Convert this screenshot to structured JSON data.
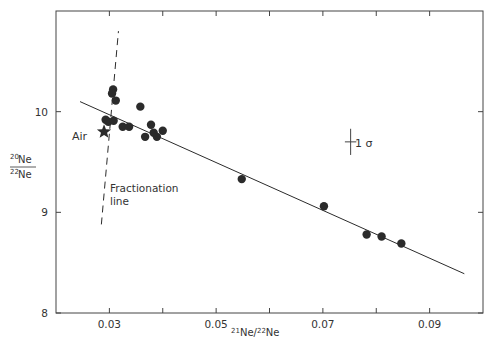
{
  "chart_data": {
    "type": "scatter",
    "title": "",
    "xlabel": "21Ne/22Ne",
    "ylabel": "20Ne/22Ne",
    "xlim": [
      0.02,
      0.1
    ],
    "ylim": [
      8,
      11
    ],
    "x_ticks": [
      0.03,
      0.04,
      0.05,
      0.06,
      0.07,
      0.08,
      0.09
    ],
    "x_tick_labels": [
      "0.03",
      "",
      "0.05",
      "",
      "0.07",
      "",
      "0.09"
    ],
    "y_ticks": [
      8,
      9,
      10
    ],
    "y_tick_labels": [
      "8",
      "9",
      "10"
    ],
    "grid": false,
    "series": [
      {
        "name": "samples",
        "marker": "filled-circle",
        "points": [
          [
            0.0307,
            10.22
          ],
          [
            0.0305,
            10.18
          ],
          [
            0.0312,
            10.11
          ],
          [
            0.0293,
            9.92
          ],
          [
            0.0298,
            9.9
          ],
          [
            0.0308,
            9.91
          ],
          [
            0.0325,
            9.85
          ],
          [
            0.0337,
            9.85
          ],
          [
            0.0358,
            10.05
          ],
          [
            0.0367,
            9.75
          ],
          [
            0.0378,
            9.87
          ],
          [
            0.0383,
            9.79
          ],
          [
            0.0389,
            9.75
          ],
          [
            0.04,
            9.81
          ],
          [
            0.0548,
            9.33
          ],
          [
            0.0702,
            9.06
          ],
          [
            0.0782,
            8.78
          ],
          [
            0.081,
            8.76
          ],
          [
            0.0847,
            8.69
          ]
        ]
      },
      {
        "name": "Air",
        "marker": "star",
        "points": [
          [
            0.029,
            9.8
          ]
        ]
      }
    ],
    "lines": [
      {
        "name": "correlation-line",
        "style": "solid",
        "from": [
          0.0245,
          10.1
        ],
        "to": [
          0.0965,
          8.39
        ]
      },
      {
        "name": "fractionation-line",
        "style": "dashed",
        "from": [
          0.0285,
          8.88
        ],
        "to": [
          0.0317,
          10.8
        ]
      }
    ],
    "error_bar": {
      "label": "1 σ",
      "x": 0.0752,
      "y": 9.7,
      "x_err": 0.0007,
      "y_err": 0.13
    },
    "annotations": [
      {
        "text": "Air",
        "x": 0.025,
        "y": 9.78
      },
      {
        "text": "Fractionation",
        "x": 0.0322,
        "y": 9.18
      },
      {
        "text": "line",
        "x": 0.0322,
        "y": 9.07
      },
      {
        "text": "1 σ",
        "x": 0.0768,
        "y": 9.71
      }
    ]
  },
  "labels": {
    "ylabel_num": "20Ne",
    "ylabel_den": "22Ne",
    "xlabel_num_sup": "21",
    "xlabel_num": "Ne/",
    "xlabel_den_sup": "22",
    "xlabel_den": "Ne",
    "air": "Air",
    "fractionation_1": "Fractionation",
    "fractionation_2": "line",
    "sigma": "1 σ",
    "y_sup_20": "20",
    "y_sup_22": "22",
    "ne": "Ne"
  }
}
